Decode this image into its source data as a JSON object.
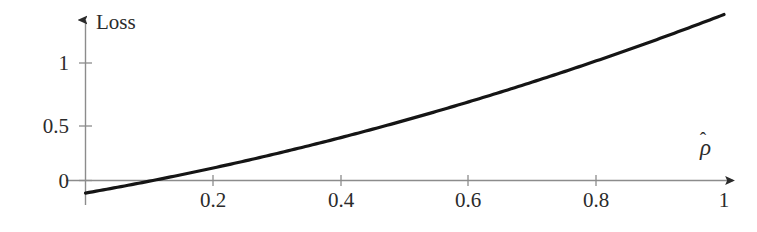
{
  "figure": {
    "background_color": "#ffffff",
    "curve_color": "#151515",
    "axis_color": "#8c8c8c",
    "text_color": "#2b2b2b"
  },
  "axes": {
    "y_axis_title": "Loss",
    "x_axis_title_glyph": "ρ",
    "x_axis_title_accent": "̂",
    "x_axis_title_plain": "ρ̂",
    "x_tick_labels": [
      "0.2",
      "0.4",
      "0.6",
      "0.8",
      "1"
    ],
    "y_tick_labels": [
      "0",
      "0.5",
      "1"
    ]
  },
  "chart_data": {
    "type": "line",
    "title": "",
    "xlabel": "ρ̂",
    "ylabel": "Loss",
    "xlim": [
      -0.02,
      1.08
    ],
    "ylim": [
      -0.12,
      1.48
    ],
    "xticks": [
      0.2,
      0.4,
      0.6,
      0.8,
      1.0
    ],
    "xtick_labels": [
      "0.2",
      "0.4",
      "0.6",
      "0.8",
      "1"
    ],
    "yticks": [
      0,
      0.5,
      1
    ],
    "ytick_labels": [
      "0",
      "0.5",
      "1"
    ],
    "grid": false,
    "legend": "none",
    "zero_crossing_x": 0.1,
    "series": [
      {
        "name": "Loss",
        "color": "#151515",
        "linewidth": 3.2,
        "x": [
          0.0,
          0.05,
          0.1,
          0.15,
          0.2,
          0.25,
          0.3,
          0.35,
          0.4,
          0.45,
          0.5,
          0.55,
          0.6,
          0.65,
          0.7,
          0.75,
          0.8,
          0.85,
          0.9,
          0.95,
          1.0
        ],
        "y": [
          -0.08,
          -0.04,
          0.0,
          0.04,
          0.09,
          0.14,
          0.19,
          0.24,
          0.39,
          0.46,
          0.54,
          0.62,
          0.64,
          0.76,
          0.85,
          0.94,
          1.03,
          1.12,
          1.21,
          1.3,
          1.39
        ]
      }
    ]
  }
}
